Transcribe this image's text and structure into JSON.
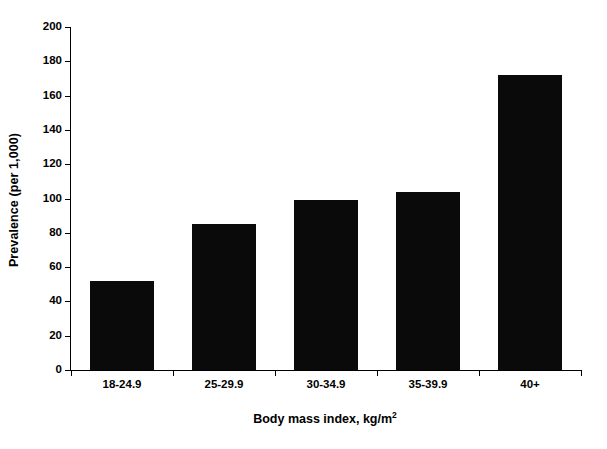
{
  "chart_data": {
    "type": "bar",
    "title": "",
    "categories": [
      "18-24.9",
      "25-29.9",
      "30-34.9",
      "35-39.9",
      "40+"
    ],
    "values": [
      52,
      85,
      99,
      104,
      172
    ],
    "series": [
      {
        "name": "Prevalence",
        "values": [
          52,
          85,
          99,
          104,
          172
        ]
      }
    ],
    "xlabel": "Body mass index, kg/m",
    "xlabel_superscript": "2",
    "ylabel": "Prevalence (per 1,000)",
    "ylim": [
      0,
      200
    ],
    "ytick_step": 20,
    "yticks": [
      0,
      20,
      40,
      60,
      80,
      100,
      120,
      140,
      160,
      180,
      200
    ],
    "ytick_labels": [
      "0",
      "20",
      "40",
      "60",
      "80",
      "100",
      "120",
      "140",
      "160",
      "180",
      "200"
    ],
    "grid": false,
    "legend": false,
    "legend_position": "none",
    "bar_color": "#0a0a0a",
    "background_color": "#ffffff",
    "axis_color": "#000000",
    "bar_width_ratio": 0.63
  }
}
